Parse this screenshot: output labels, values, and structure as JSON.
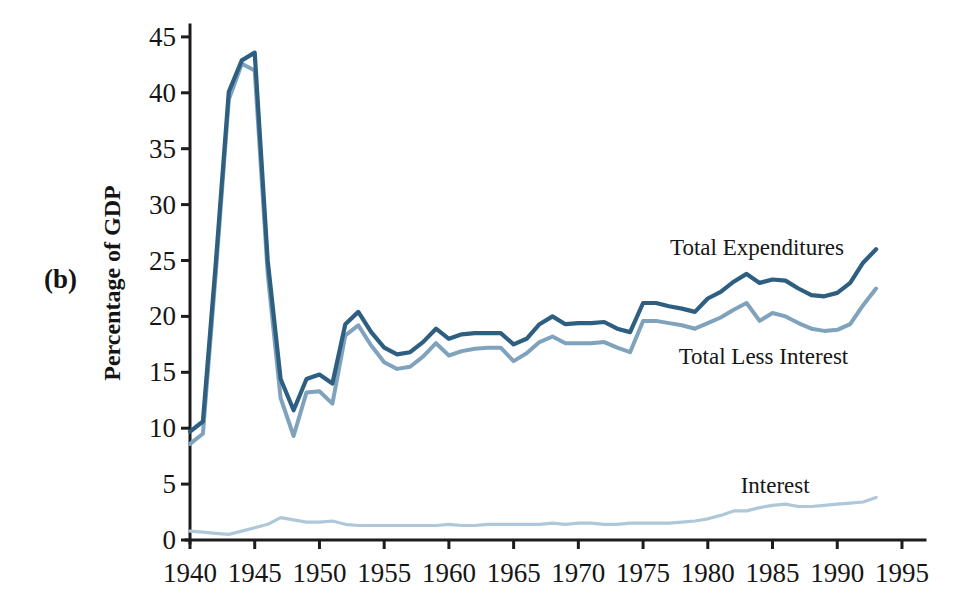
{
  "chart": {
    "panel_label": "(b)"
  },
  "chart_data": {
    "type": "line",
    "title": "",
    "xlabel": "",
    "ylabel": "Percentage of GDP",
    "xlim": [
      1940,
      1995
    ],
    "ylim": [
      0,
      45
    ],
    "grid": false,
    "legend_position": "inline-annotations",
    "x_ticks": [
      1940,
      1945,
      1950,
      1955,
      1960,
      1965,
      1970,
      1975,
      1980,
      1985,
      1990,
      1995
    ],
    "y_ticks": [
      0,
      5,
      10,
      15,
      20,
      25,
      30,
      35,
      40,
      45
    ],
    "x": [
      1940,
      1941,
      1942,
      1943,
      1944,
      1945,
      1946,
      1947,
      1948,
      1949,
      1950,
      1951,
      1952,
      1953,
      1954,
      1955,
      1956,
      1957,
      1958,
      1959,
      1960,
      1961,
      1962,
      1963,
      1964,
      1965,
      1966,
      1967,
      1968,
      1969,
      1970,
      1971,
      1972,
      1973,
      1974,
      1975,
      1976,
      1977,
      1978,
      1979,
      1980,
      1981,
      1982,
      1983,
      1984,
      1985,
      1986,
      1987,
      1988,
      1989,
      1990,
      1991,
      1992,
      1993
    ],
    "series": [
      {
        "name": "Interest",
        "color": "#aec8da",
        "stroke_width": 3.2,
        "values": [
          0.8,
          0.7,
          0.6,
          0.5,
          0.8,
          1.1,
          1.4,
          2.0,
          1.8,
          1.6,
          1.6,
          1.7,
          1.4,
          1.3,
          1.3,
          1.3,
          1.3,
          1.3,
          1.3,
          1.3,
          1.4,
          1.3,
          1.3,
          1.4,
          1.4,
          1.4,
          1.4,
          1.4,
          1.5,
          1.4,
          1.5,
          1.5,
          1.4,
          1.4,
          1.5,
          1.5,
          1.5,
          1.5,
          1.6,
          1.7,
          1.9,
          2.2,
          2.6,
          2.6,
          2.9,
          3.1,
          3.2,
          3.0,
          3.0,
          3.1,
          3.2,
          3.3,
          3.4,
          3.8
        ]
      },
      {
        "name": "Total Less Interest",
        "color": "#7fa2bd",
        "stroke_width": 4.0,
        "values": [
          8.6,
          9.5,
          24.0,
          39.4,
          42.6,
          42.0,
          23.8,
          12.7,
          9.3,
          13.2,
          13.3,
          12.2,
          18.3,
          19.2,
          17.4,
          15.9,
          15.3,
          15.5,
          16.4,
          17.6,
          16.5,
          16.9,
          17.1,
          17.2,
          17.2,
          16.0,
          16.7,
          17.7,
          18.2,
          17.6,
          17.6,
          17.6,
          17.7,
          17.2,
          16.8,
          19.6,
          19.6,
          19.4,
          19.2,
          18.9,
          19.4,
          19.9,
          20.6,
          21.2,
          19.6,
          20.3,
          20.0,
          19.4,
          18.9,
          18.7,
          18.8,
          19.3,
          21.0,
          22.5
        ]
      },
      {
        "name": "Total Expenditures",
        "color": "#2e5f80",
        "stroke_width": 4.2,
        "values": [
          9.7,
          10.6,
          24.9,
          40.1,
          42.9,
          43.6,
          25.0,
          14.4,
          11.6,
          14.4,
          14.8,
          14.0,
          19.3,
          20.4,
          18.6,
          17.2,
          16.6,
          16.8,
          17.7,
          18.9,
          18.0,
          18.4,
          18.5,
          18.5,
          18.5,
          17.5,
          18.0,
          19.3,
          20.0,
          19.3,
          19.4,
          19.4,
          19.5,
          18.9,
          18.6,
          21.2,
          21.2,
          20.9,
          20.7,
          20.4,
          21.6,
          22.2,
          23.1,
          23.8,
          23.0,
          23.3,
          23.2,
          22.5,
          21.9,
          21.8,
          22.1,
          23.0,
          24.8,
          26.0
        ]
      }
    ],
    "annotations": [
      {
        "text": "Total Expenditures",
        "x": 1983.8,
        "y": 25.5
      },
      {
        "text": "Total Less Interest",
        "x": 1984.3,
        "y": 15.7
      },
      {
        "text": "Interest",
        "x": 1985.2,
        "y": 4.2
      }
    ]
  }
}
